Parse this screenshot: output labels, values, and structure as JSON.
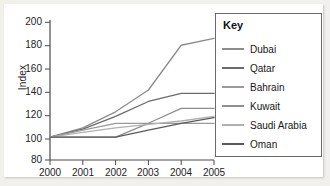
{
  "chart_data": {
    "type": "line",
    "title": "",
    "xlabel": "",
    "ylabel": "Index",
    "x": [
      2000,
      2001,
      2002,
      2003,
      2004,
      2005
    ],
    "xtick_labels": [
      "2000",
      "2001",
      "2002",
      "2003",
      "2004",
      "2005"
    ],
    "ytick_labels": [
      "80",
      "100",
      "120",
      "140",
      "160",
      "180",
      "200"
    ],
    "yticks": [
      80,
      100,
      120,
      140,
      160,
      180,
      200
    ],
    "ylim": [
      80,
      200
    ],
    "xlim": [
      2000,
      2005
    ],
    "grid": false,
    "legend_position": "right",
    "legend_title": "Key",
    "series": [
      {
        "name": "Dubai",
        "color": "#8c8c8c",
        "values": [
          100,
          108,
          122,
          141,
          180,
          186
        ]
      },
      {
        "name": "Qatar",
        "color": "#6b6b6b",
        "values": [
          100,
          107,
          118,
          131,
          138,
          138
        ]
      },
      {
        "name": "Bahrain",
        "color": "#9a9a9a",
        "values": [
          100,
          106,
          112,
          112,
          112,
          112
        ]
      },
      {
        "name": "Kuwait",
        "color": "#8f8f8f",
        "values": [
          100,
          100,
          100,
          112,
          125,
          125
        ]
      },
      {
        "name": "Saudi Arabia",
        "color": "#b0b0b0",
        "values": [
          100,
          104,
          108,
          111,
          114,
          118
        ]
      },
      {
        "name": "Oman",
        "color": "#5a5a5a",
        "values": [
          100,
          100,
          100,
          106,
          112,
          117
        ]
      }
    ]
  },
  "legend": {
    "title": "Key",
    "items": [
      {
        "label": "Dubai"
      },
      {
        "label": "Qatar"
      },
      {
        "label": "Bahrain"
      },
      {
        "label": "Kuwait"
      },
      {
        "label": "Saudi Arabia"
      },
      {
        "label": "Oman"
      }
    ]
  },
  "axes": {
    "y_axis_title": "Index"
  },
  "colors": {
    "axis": "#4a4a4a",
    "text": "#1d1d1d",
    "legend_border": "#6a6a6a",
    "paper": "#ffffff",
    "page": "#f2f0ec"
  }
}
